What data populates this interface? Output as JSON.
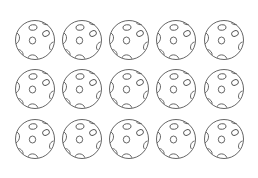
{
  "figure": {
    "background": "#ffffff",
    "stroke_color": "#555555",
    "object": "perforated-ball",
    "rows": 3,
    "columns": 5,
    "count": 15,
    "balls": [
      {
        "row": 1,
        "col": 1,
        "x": 35,
        "y": 40
      },
      {
        "row": 1,
        "col": 2,
        "x": 82,
        "y": 40
      },
      {
        "row": 1,
        "col": 3,
        "x": 129,
        "y": 40
      },
      {
        "row": 1,
        "col": 4,
        "x": 176,
        "y": 40
      },
      {
        "row": 1,
        "col": 5,
        "x": 224,
        "y": 40
      },
      {
        "row": 2,
        "col": 1,
        "x": 35,
        "y": 89
      },
      {
        "row": 2,
        "col": 2,
        "x": 82,
        "y": 89
      },
      {
        "row": 2,
        "col": 3,
        "x": 129,
        "y": 89
      },
      {
        "row": 2,
        "col": 4,
        "x": 176,
        "y": 89
      },
      {
        "row": 2,
        "col": 5,
        "x": 224,
        "y": 89
      },
      {
        "row": 3,
        "col": 1,
        "x": 35,
        "y": 139
      },
      {
        "row": 3,
        "col": 2,
        "x": 82,
        "y": 139
      },
      {
        "row": 3,
        "col": 3,
        "x": 129,
        "y": 139
      },
      {
        "row": 3,
        "col": 4,
        "x": 176,
        "y": 139
      },
      {
        "row": 3,
        "col": 5,
        "x": 224,
        "y": 139
      }
    ]
  }
}
